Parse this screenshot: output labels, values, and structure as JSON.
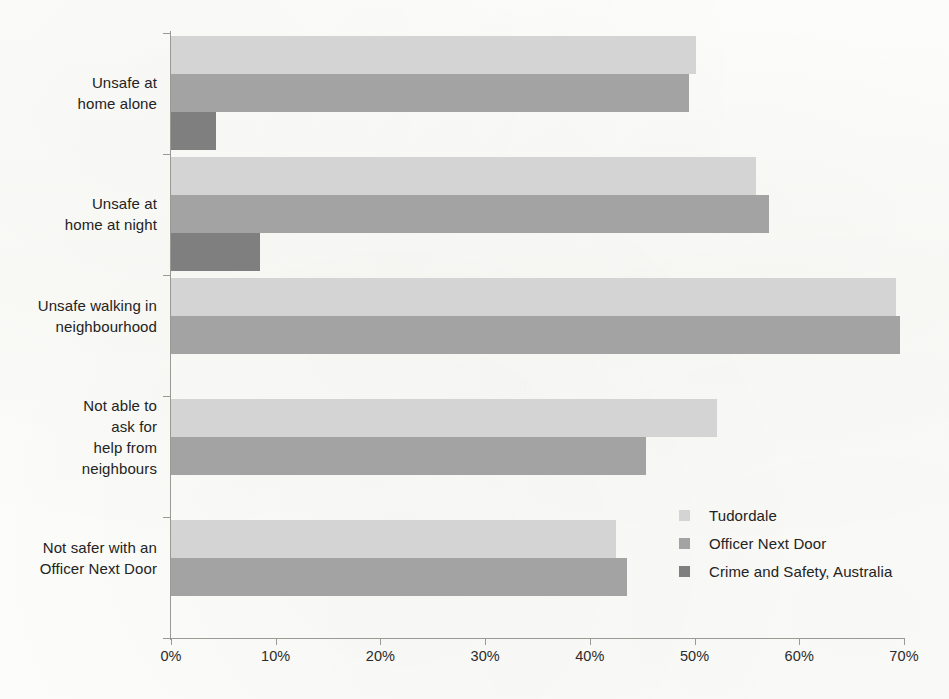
{
  "chart_data": {
    "type": "bar",
    "orientation": "horizontal",
    "title": "",
    "subtitle": "",
    "xlabel": "",
    "ylabel": "",
    "xlim": [
      0,
      70
    ],
    "xunit": "%",
    "grid": false,
    "legend_position": "inside-bottom-right",
    "categories": [
      "Unsafe at\nhome alone",
      "Unsafe at\nhome at night",
      "Unsafe walking in\nneighbourhood",
      "Not able to\nask for\nhelp from\nneighbours",
      "Not safer with an\nOfficer Next Door"
    ],
    "tick_labels": [
      "0%",
      "10%",
      "20%",
      "30%",
      "40%",
      "50%",
      "60%",
      "70%"
    ],
    "tick_values": [
      0,
      10,
      20,
      30,
      40,
      50,
      60,
      70
    ],
    "series": [
      {
        "name": "Tudordale",
        "color": "#d4d4d4",
        "values": [
          50.1,
          55.9,
          69.2,
          52.1,
          42.5
        ]
      },
      {
        "name": "Officer Next Door",
        "color": "#a3a3a3",
        "values": [
          49.5,
          57.1,
          69.6,
          45.4,
          43.5
        ]
      },
      {
        "name": "Crime and Safety, Australia",
        "color": "#7f7f7f",
        "values": [
          4.3,
          8.5,
          null,
          null,
          null
        ]
      }
    ]
  }
}
